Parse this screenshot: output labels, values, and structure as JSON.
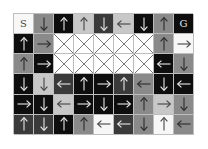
{
  "gridworld": {
    "rows": 6,
    "cols": 9,
    "shades": {
      "white": "#f7f7f7",
      "light": "#c8c8c8",
      "gray": "#8a8a8a",
      "dark": "#3a3a3a",
      "black": "#0e0e0e"
    },
    "cells": [
      [
        {
          "type": "start",
          "label": "S",
          "shade": "white"
        },
        {
          "type": "arrow",
          "dir": "down",
          "shade": "gray"
        },
        {
          "type": "arrow",
          "dir": "up",
          "shade": "black"
        },
        {
          "type": "arrow",
          "dir": "up",
          "shade": "light"
        },
        {
          "type": "arrow",
          "dir": "down",
          "shade": "dark"
        },
        {
          "type": "arrow",
          "dir": "left",
          "shade": "light"
        },
        {
          "type": "arrow",
          "dir": "down",
          "shade": "black"
        },
        {
          "type": "arrow",
          "dir": "up",
          "shade": "gray"
        },
        {
          "type": "goal",
          "label": "G",
          "shade": "black"
        }
      ],
      [
        {
          "type": "arrow",
          "dir": "up",
          "shade": "black"
        },
        {
          "type": "arrow",
          "dir": "right",
          "shade": "gray"
        },
        {
          "type": "wall"
        },
        {
          "type": "wall"
        },
        {
          "type": "wall"
        },
        {
          "type": "wall"
        },
        {
          "type": "wall"
        },
        {
          "type": "arrow",
          "dir": "up",
          "shade": "gray"
        },
        {
          "type": "arrow",
          "dir": "right",
          "shade": "white"
        }
      ],
      [
        {
          "type": "arrow",
          "dir": "up",
          "shade": "gray"
        },
        {
          "type": "arrow",
          "dir": "right",
          "shade": "black"
        },
        {
          "type": "wall"
        },
        {
          "type": "wall"
        },
        {
          "type": "wall"
        },
        {
          "type": "wall"
        },
        {
          "type": "wall"
        },
        {
          "type": "arrow",
          "dir": "left",
          "shade": "black"
        },
        {
          "type": "arrow",
          "dir": "down",
          "shade": "gray"
        }
      ],
      [
        {
          "type": "arrow",
          "dir": "down",
          "shade": "black"
        },
        {
          "type": "arrow",
          "dir": "down",
          "shade": "light"
        },
        {
          "type": "arrow",
          "dir": "left",
          "shade": "dark"
        },
        {
          "type": "arrow",
          "dir": "up",
          "shade": "black"
        },
        {
          "type": "arrow",
          "dir": "right",
          "shade": "black"
        },
        {
          "type": "arrow",
          "dir": "up",
          "shade": "dark"
        },
        {
          "type": "arrow",
          "dir": "left",
          "shade": "gray"
        },
        {
          "type": "arrow",
          "dir": "down",
          "shade": "black"
        },
        {
          "type": "arrow",
          "dir": "left",
          "shade": "black"
        }
      ],
      [
        {
          "type": "arrow",
          "dir": "right",
          "shade": "black"
        },
        {
          "type": "arrow",
          "dir": "down",
          "shade": "black"
        },
        {
          "type": "arrow",
          "dir": "left",
          "shade": "light"
        },
        {
          "type": "arrow",
          "dir": "right",
          "shade": "black"
        },
        {
          "type": "arrow",
          "dir": "down",
          "shade": "black"
        },
        {
          "type": "arrow",
          "dir": "right",
          "shade": "black"
        },
        {
          "type": "arrow",
          "dir": "up",
          "shade": "gray"
        },
        {
          "type": "arrow",
          "dir": "right",
          "shade": "light"
        },
        {
          "type": "arrow",
          "dir": "down",
          "shade": "gray"
        }
      ],
      [
        {
          "type": "arrow",
          "dir": "up",
          "shade": "dark"
        },
        {
          "type": "arrow",
          "dir": "down",
          "shade": "dark"
        },
        {
          "type": "arrow",
          "dir": "up",
          "shade": "black"
        },
        {
          "type": "arrow",
          "dir": "up",
          "shade": "gray"
        },
        {
          "type": "arrow",
          "dir": "left",
          "shade": "white"
        },
        {
          "type": "arrow",
          "dir": "left",
          "shade": "dark"
        },
        {
          "type": "arrow",
          "dir": "down",
          "shade": "gray"
        },
        {
          "type": "arrow",
          "dir": "up",
          "shade": "white"
        },
        {
          "type": "arrow",
          "dir": "left",
          "shade": "gray"
        }
      ]
    ]
  }
}
